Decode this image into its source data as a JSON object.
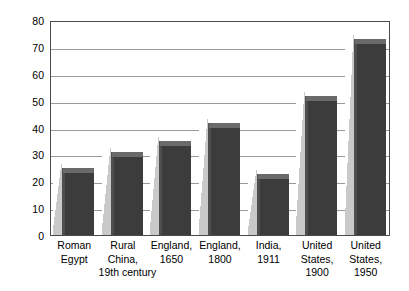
{
  "chart_data": {
    "type": "bar",
    "title": "",
    "subtitle": "",
    "xlabel": "",
    "ylabel": "Age (years)",
    "ylim": [
      0,
      80
    ],
    "yticks": [
      0,
      10,
      20,
      30,
      40,
      50,
      60,
      70,
      80
    ],
    "ytick_labels": [
      "0",
      "10",
      "20",
      "30",
      "40",
      "50",
      "60",
      "70",
      "80"
    ],
    "grid": "horizontal",
    "legend": "none",
    "categories": [
      "Roman Egypt",
      "Rural China, 19th century",
      "England, 1650",
      "England, 1800",
      "India, 1911",
      "United States, 1900",
      "United States, 1950"
    ],
    "category_lines": [
      [
        "Roman",
        "Egypt"
      ],
      [
        "Rural",
        "China,",
        "19th century"
      ],
      [
        "England,",
        "1650"
      ],
      [
        "England,",
        "1800"
      ],
      [
        "India,",
        "1911"
      ],
      [
        "United",
        "States,",
        "1900"
      ],
      [
        "United",
        "States,",
        "1950"
      ]
    ],
    "values": [
      23,
      29,
      33,
      40,
      21,
      50,
      71
    ],
    "series": [
      {
        "name": "Life expectancy at birth",
        "values": [
          23,
          29,
          33,
          40,
          21,
          50,
          71
        ]
      }
    ],
    "style": {
      "bar_face_color": "#3c3c3c",
      "bar_top_color": "#6a6a6a",
      "bar_shadow_color": "#c9c9c9",
      "gridline_color": "#9a9a9a",
      "frame_color": "#4a4a4a",
      "background_color": "#ffffff",
      "three_d": true
    }
  }
}
